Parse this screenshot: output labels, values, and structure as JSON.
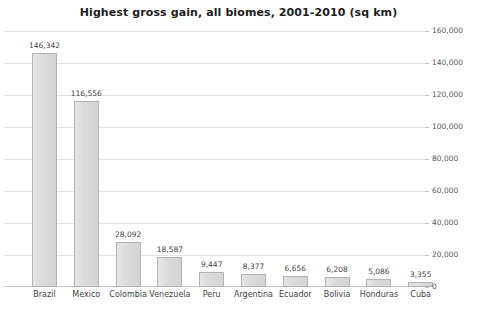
{
  "chart_data": {
    "type": "bar",
    "title": "Highest gross gain, all biomes, 2001-2010 (sq km)",
    "xlabel": "",
    "ylabel": "",
    "categories": [
      "Brazil",
      "Mexico",
      "Colombia",
      "Venezuela",
      "Peru",
      "Argentina",
      "Ecuador",
      "Bolivia",
      "Honduras",
      "Cuba"
    ],
    "values": [
      146342,
      116556,
      28092,
      18587,
      9447,
      8377,
      6656,
      6208,
      5086,
      3355
    ],
    "value_labels": [
      "146,342",
      "116,556",
      "28,092",
      "18,587",
      "9,447",
      "8,377",
      "6,656",
      "6,208",
      "5,086",
      "3,355"
    ],
    "ylim": [
      0,
      160000
    ],
    "ytick_values": [
      0,
      20000,
      40000,
      60000,
      80000,
      100000,
      120000,
      140000,
      160000
    ],
    "ytick_labels": [
      "0",
      "20,000",
      "40,000",
      "60,000",
      "80,000",
      "100,000",
      "120,000",
      "140,000",
      "160,000"
    ],
    "yaxis_position": "right",
    "grid": true,
    "legend": false,
    "bar_color": "#dcdcdc",
    "bar_border_color": "#b4b4b4",
    "grid_color": "#e3e3e3",
    "text_color": "#3f3f3f",
    "title_color": "#1d1d1d",
    "background": "#ffffff"
  }
}
